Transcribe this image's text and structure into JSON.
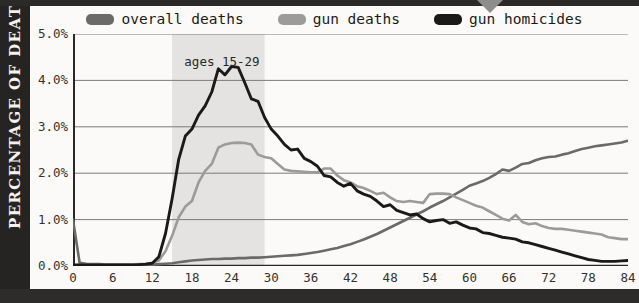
{
  "frame": {
    "y_axis_title": "PERCENTAGE OF DEATHS",
    "marker_icon": "chevron-down-icon"
  },
  "legend": {
    "position": "top-center",
    "items": [
      {
        "label": "overall deaths",
        "color": "#6b6a68",
        "icon": "legend-swatch-icon"
      },
      {
        "label": "gun deaths",
        "color": "#9c9b99",
        "icon": "legend-swatch-icon"
      },
      {
        "label": "gun homicides",
        "color": "#1c1a18",
        "icon": "legend-swatch-icon"
      }
    ]
  },
  "annotations": [
    {
      "text": "ages 15-29",
      "x_start": 15,
      "x_end": 29,
      "shade_color": "#e4e3e1"
    }
  ],
  "axes": {
    "y_ticks": [
      "0.0%",
      "1.0%",
      "2.0%",
      "3.0%",
      "4.0%",
      "5.0%"
    ],
    "x_ticks": [
      "0",
      "6",
      "12",
      "18",
      "24",
      "30",
      "36",
      "42",
      "48",
      "54",
      "60",
      "66",
      "72",
      "78",
      "84"
    ]
  },
  "chart_data": {
    "type": "line",
    "title": "",
    "subtitle": "",
    "xlabel": "",
    "ylabel": "PERCENTAGE OF DEATHS",
    "xlim": [
      0,
      84
    ],
    "ylim": [
      0,
      5.0
    ],
    "ytick_values": [
      0.0,
      1.0,
      2.0,
      3.0,
      4.0,
      5.0
    ],
    "xtick_values": [
      0,
      6,
      12,
      18,
      24,
      30,
      36,
      42,
      48,
      54,
      60,
      66,
      72,
      78,
      84
    ],
    "grid": "horizontal",
    "legend_position": "top-center",
    "shaded_region": {
      "label": "ages 15-29",
      "from": 15,
      "to": 29
    },
    "x": [
      0,
      1,
      2,
      3,
      4,
      5,
      6,
      7,
      8,
      9,
      10,
      11,
      12,
      13,
      14,
      15,
      16,
      17,
      18,
      19,
      20,
      21,
      22,
      23,
      24,
      25,
      26,
      27,
      28,
      29,
      30,
      31,
      32,
      33,
      34,
      35,
      36,
      37,
      38,
      39,
      40,
      41,
      42,
      43,
      44,
      45,
      46,
      47,
      48,
      49,
      50,
      51,
      52,
      53,
      54,
      55,
      56,
      57,
      58,
      59,
      60,
      61,
      62,
      63,
      64,
      65,
      66,
      67,
      68,
      69,
      70,
      71,
      72,
      73,
      74,
      75,
      76,
      77,
      78,
      79,
      80,
      81,
      82,
      83,
      84
    ],
    "series": [
      {
        "name": "overall deaths",
        "color": "#6b6a68",
        "values": [
          1.0,
          0.07,
          0.05,
          0.04,
          0.04,
          0.03,
          0.03,
          0.03,
          0.03,
          0.03,
          0.03,
          0.03,
          0.03,
          0.04,
          0.05,
          0.06,
          0.08,
          0.1,
          0.12,
          0.13,
          0.14,
          0.15,
          0.15,
          0.16,
          0.16,
          0.17,
          0.17,
          0.18,
          0.18,
          0.19,
          0.2,
          0.21,
          0.22,
          0.23,
          0.24,
          0.26,
          0.28,
          0.3,
          0.33,
          0.36,
          0.39,
          0.43,
          0.47,
          0.52,
          0.57,
          0.63,
          0.69,
          0.76,
          0.83,
          0.9,
          0.97,
          1.04,
          1.11,
          1.18,
          1.26,
          1.33,
          1.4,
          1.48,
          1.56,
          1.64,
          1.73,
          1.78,
          1.83,
          1.9,
          1.98,
          2.08,
          2.05,
          2.12,
          2.2,
          2.22,
          2.28,
          2.32,
          2.35,
          2.36,
          2.4,
          2.43,
          2.48,
          2.52,
          2.55,
          2.58,
          2.6,
          2.62,
          2.64,
          2.66,
          2.7
        ]
      },
      {
        "name": "gun deaths",
        "color": "#9c9b99",
        "values": [
          0.02,
          0.02,
          0.02,
          0.02,
          0.02,
          0.02,
          0.02,
          0.02,
          0.02,
          0.03,
          0.04,
          0.05,
          0.07,
          0.12,
          0.32,
          0.65,
          1.05,
          1.28,
          1.4,
          1.8,
          2.05,
          2.2,
          2.55,
          2.62,
          2.65,
          2.66,
          2.65,
          2.62,
          2.4,
          2.35,
          2.32,
          2.2,
          2.08,
          2.05,
          2.04,
          2.03,
          2.02,
          2.02,
          2.1,
          2.1,
          1.95,
          1.85,
          1.8,
          1.72,
          1.68,
          1.62,
          1.55,
          1.58,
          1.48,
          1.4,
          1.38,
          1.4,
          1.38,
          1.36,
          1.55,
          1.56,
          1.56,
          1.55,
          1.48,
          1.42,
          1.36,
          1.3,
          1.26,
          1.18,
          1.1,
          1.02,
          0.98,
          1.1,
          0.95,
          0.9,
          0.92,
          0.86,
          0.82,
          0.8,
          0.8,
          0.78,
          0.76,
          0.74,
          0.72,
          0.7,
          0.68,
          0.62,
          0.6,
          0.58,
          0.58
        ]
      },
      {
        "name": "gun homicides",
        "color": "#1c1a18",
        "values": [
          0.02,
          0.02,
          0.02,
          0.02,
          0.02,
          0.02,
          0.02,
          0.02,
          0.02,
          0.02,
          0.03,
          0.04,
          0.06,
          0.2,
          0.7,
          1.45,
          2.3,
          2.8,
          2.95,
          3.25,
          3.45,
          3.75,
          4.25,
          4.12,
          4.3,
          4.28,
          3.95,
          3.6,
          3.55,
          3.2,
          2.95,
          2.8,
          2.62,
          2.5,
          2.52,
          2.32,
          2.25,
          2.15,
          1.95,
          1.92,
          1.8,
          1.72,
          1.78,
          1.62,
          1.55,
          1.5,
          1.4,
          1.28,
          1.32,
          1.2,
          1.15,
          1.1,
          1.12,
          1.02,
          0.95,
          0.98,
          1.0,
          0.92,
          0.95,
          0.88,
          0.82,
          0.8,
          0.72,
          0.7,
          0.66,
          0.62,
          0.6,
          0.58,
          0.52,
          0.5,
          0.46,
          0.42,
          0.38,
          0.34,
          0.3,
          0.26,
          0.22,
          0.18,
          0.14,
          0.12,
          0.1,
          0.1,
          0.1,
          0.11,
          0.12
        ]
      }
    ]
  }
}
